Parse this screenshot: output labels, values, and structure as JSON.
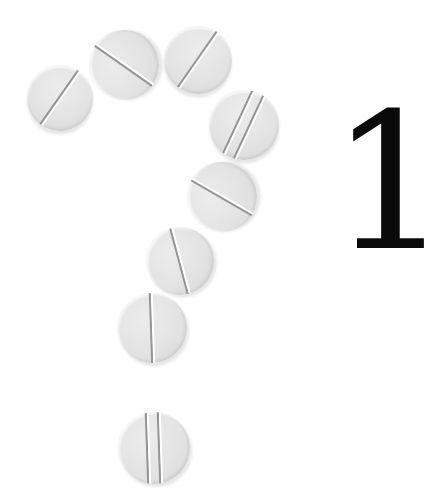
{
  "numeral": "1",
  "colors": {
    "background": "#ffffff",
    "pill": "#e4e4e4",
    "score_line": "#8d8d8d",
    "numeral": "#0a0a0a"
  },
  "pills": [
    {
      "cx": 60,
      "cy": 98,
      "r": 33,
      "score_angle": 35,
      "scores": 1
    },
    {
      "cx": 124,
      "cy": 65,
      "r": 35,
      "score_angle": -55,
      "scores": 1
    },
    {
      "cx": 198,
      "cy": 60,
      "r": 34,
      "score_angle": 35,
      "scores": 1
    },
    {
      "cx": 244,
      "cy": 125,
      "r": 35,
      "score_angle": 25,
      "scores": 2
    },
    {
      "cx": 222,
      "cy": 197,
      "r": 35,
      "score_angle": -60,
      "scores": 1
    },
    {
      "cx": 180,
      "cy": 261,
      "r": 34,
      "score_angle": -15,
      "scores": 1
    },
    {
      "cx": 152,
      "cy": 328,
      "r": 35,
      "score_angle": -2,
      "scores": 1
    },
    {
      "cx": 154,
      "cy": 448,
      "r": 36,
      "score_angle": -2,
      "scores": 2
    }
  ]
}
